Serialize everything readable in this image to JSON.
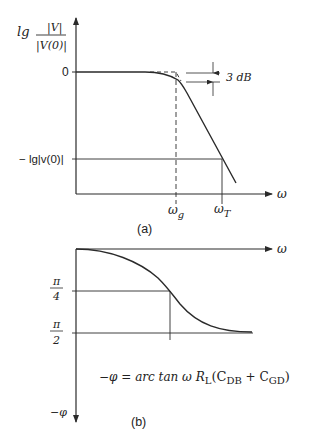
{
  "figure_a": {
    "y_label_prefix": "lg",
    "y_label_numerator": "|V|",
    "y_label_denominator": "|V(0)|",
    "tick_zero": "0",
    "tick_low": "− lg|v(0)|",
    "annotation_3db": "3 dB",
    "x_axis_label": "ω",
    "x_tick_g": "ω",
    "x_tick_g_sub": "g",
    "x_tick_t": "ω",
    "x_tick_t_sub": "T",
    "caption": "(a)"
  },
  "figure_b": {
    "x_axis_label": "ω",
    "y_axis_label": "−φ",
    "tick_pi4_num": "π",
    "tick_pi4_den": "4",
    "tick_pi2_num": "π",
    "tick_pi2_den": "2",
    "formula_lhs": "−φ = arc tan ω R",
    "formula_sub_l": "L",
    "formula_paren_open": "(C",
    "formula_sub_db": "DB",
    "formula_plus": " + C",
    "formula_sub_gd": "GD",
    "formula_paren_close": ")",
    "caption": "(b)"
  },
  "colors": {
    "ink": "#2a2a2a",
    "background": "#ffffff"
  }
}
